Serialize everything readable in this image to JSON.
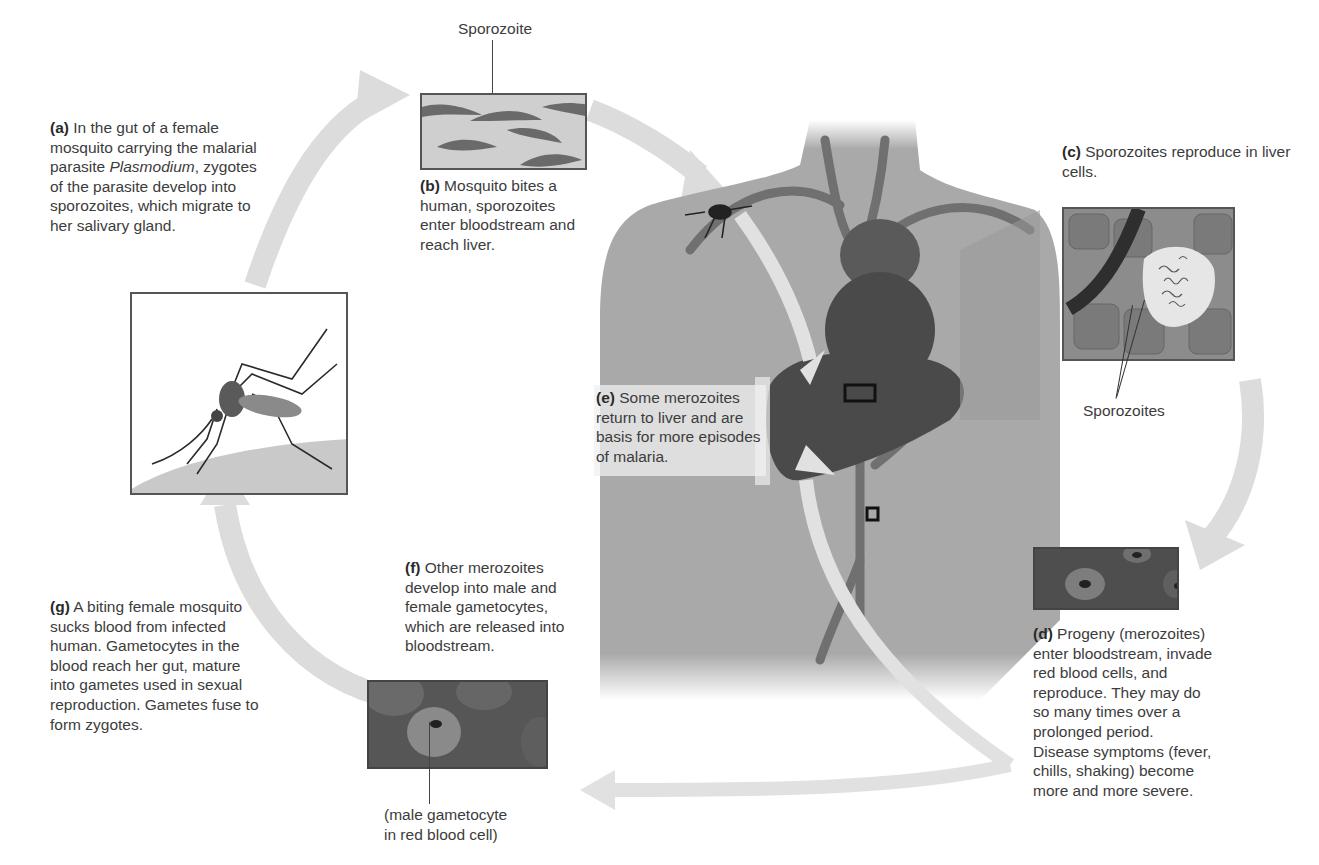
{
  "colors": {
    "arrow": "#d9d9d9",
    "body": "#a9a9a9",
    "organ_dark": "#4a4a4a",
    "vessel": "#6e6e6e",
    "panel_border": "#555555",
    "text": "#3c3c3c"
  },
  "steps": [
    {
      "id": "a",
      "letter": "(a)",
      "text_before": " In the gut of a female mosquito carrying the malarial parasite ",
      "italic": "Plasmodium",
      "text_after": ", zygotes of the parasite develop into sporozoites, which migrate to her salivary gland."
    },
    {
      "id": "b",
      "letter": "(b)",
      "text": " Mosquito bites a human, sporozoites enter bloodstream and reach liver."
    },
    {
      "id": "c",
      "letter": "(c)",
      "text": " Sporozoites reproduce in liver cells."
    },
    {
      "id": "d",
      "letter": "(d)",
      "text": " Progeny (merozoites) enter bloodstream, invade red blood cells, and reproduce. They may do so many times over a prolonged period. Disease symptoms (fever, chills, shaking) become more and more severe."
    },
    {
      "id": "e",
      "letter": "(e)",
      "text": " Some merozoites return to liver and are basis for more episodes of malaria."
    },
    {
      "id": "f",
      "letter": "(f)",
      "text": " Other merozoites develop into male and female gametocytes, which are released into bloodstream."
    },
    {
      "id": "g",
      "letter": "(g)",
      "text": " A biting female mosquito sucks blood from infected human. Gametocytes in the blood reach her gut, mature into gametes used in sexual reproduction. Gametes fuse to form zygotes."
    }
  ],
  "labels": {
    "sporozoite": "Sporozoite",
    "sporozoites": "Sporozoites",
    "gametocyte_line1": "(male gametocyte",
    "gametocyte_line2": "in red blood cell)"
  },
  "icons": {
    "mosquito": "mosquito-icon",
    "liver": "liver-icon",
    "heart": "heart-icon"
  }
}
